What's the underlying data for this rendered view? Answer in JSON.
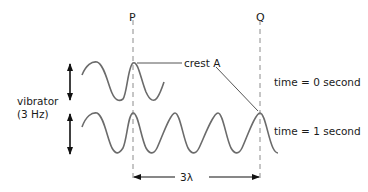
{
  "labels": {
    "p": "P",
    "q": "Q",
    "crest": "crest A",
    "time0": "time = 0 second",
    "time1": "time = 1 second",
    "vibrator_line1": "vibrator",
    "vibrator_line2": "(3 Hz)",
    "distance": "3λ"
  },
  "colors": {
    "wave": "#6b6b6b",
    "dashed": "#8c8c8c",
    "arrow": "#111111",
    "text": "#1a1a1a"
  },
  "diagram": {
    "vibrator_frequency_hz": 3,
    "distance_PQ_wavelengths": 3,
    "waves": [
      {
        "time_s": 0,
        "crests_visible": 2
      },
      {
        "time_s": 1,
        "crests_visible": 4
      }
    ]
  }
}
